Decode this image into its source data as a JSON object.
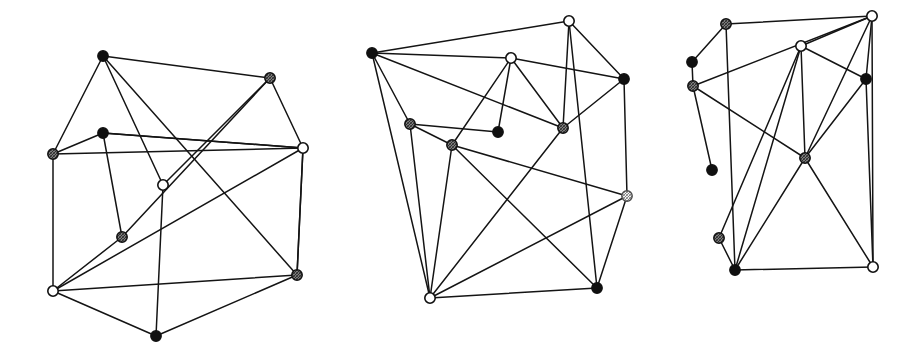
{
  "figure": {
    "background_color": "#ffffff",
    "edge_color": "#141414",
    "width": 915,
    "height": 349,
    "node_radius": 5.2,
    "node_types": {
      "black": {
        "label": "filled black vertex",
        "fill": "#101010",
        "stroke": "#101010"
      },
      "gray": {
        "label": "hatched gray vertex",
        "fill": "#8c8c8c",
        "stroke": "#101010"
      },
      "white": {
        "label": "open white vertex",
        "fill": "#ffffff",
        "stroke": "#101010"
      },
      "light": {
        "label": "light hatched vertex",
        "fill": "#e8e8e8",
        "stroke": "#4a4a4a"
      }
    }
  },
  "graphs": [
    {
      "name": "graph-left",
      "label": "Left graph",
      "node_count": 10,
      "edge_count": 20,
      "nodes": [
        {
          "id": "L0",
          "x": 103,
          "y": 56,
          "type": "black"
        },
        {
          "id": "L1",
          "x": 270,
          "y": 78,
          "type": "gray"
        },
        {
          "id": "L2",
          "x": 303,
          "y": 148,
          "type": "white"
        },
        {
          "id": "L3",
          "x": 103,
          "y": 133,
          "type": "black"
        },
        {
          "id": "L4",
          "x": 53,
          "y": 154,
          "type": "gray"
        },
        {
          "id": "L5",
          "x": 163,
          "y": 185,
          "type": "white"
        },
        {
          "id": "L6",
          "x": 122,
          "y": 237,
          "type": "gray"
        },
        {
          "id": "L7",
          "x": 53,
          "y": 291,
          "type": "white"
        },
        {
          "id": "L8",
          "x": 297,
          "y": 275,
          "type": "gray"
        },
        {
          "id": "L9",
          "x": 156,
          "y": 336,
          "type": "black"
        }
      ],
      "edges": [
        [
          "L0",
          "L1"
        ],
        [
          "L0",
          "L4"
        ],
        [
          "L0",
          "L5"
        ],
        [
          "L0",
          "L8"
        ],
        [
          "L1",
          "L2"
        ],
        [
          "L1",
          "L6"
        ],
        [
          "L2",
          "L3"
        ],
        [
          "L2",
          "L4"
        ],
        [
          "L2",
          "L7"
        ],
        [
          "L2",
          "L8"
        ],
        [
          "L3",
          "L4"
        ],
        [
          "L3",
          "L6"
        ],
        [
          "L3",
          "L2"
        ],
        [
          "L4",
          "L7"
        ],
        [
          "L5",
          "L9"
        ],
        [
          "L5",
          "L1"
        ],
        [
          "L6",
          "L7"
        ],
        [
          "L7",
          "L8"
        ],
        [
          "L7",
          "L9"
        ],
        [
          "L8",
          "L9"
        ],
        [
          "L8",
          "L2"
        ]
      ]
    },
    {
      "name": "graph-middle",
      "label": "Middle graph",
      "node_count": 10,
      "edge_count": 22,
      "nodes": [
        {
          "id": "M0",
          "x": 569,
          "y": 21,
          "type": "white"
        },
        {
          "id": "M1",
          "x": 372,
          "y": 53,
          "type": "black"
        },
        {
          "id": "M2",
          "x": 511,
          "y": 58,
          "type": "white"
        },
        {
          "id": "M3",
          "x": 624,
          "y": 79,
          "type": "black"
        },
        {
          "id": "M4",
          "x": 410,
          "y": 124,
          "type": "gray"
        },
        {
          "id": "M5",
          "x": 498,
          "y": 132,
          "type": "black"
        },
        {
          "id": "M6",
          "x": 563,
          "y": 128,
          "type": "gray"
        },
        {
          "id": "M7",
          "x": 452,
          "y": 145,
          "type": "gray"
        },
        {
          "id": "M8",
          "x": 627,
          "y": 196,
          "type": "light"
        },
        {
          "id": "M9",
          "x": 430,
          "y": 298,
          "type": "white"
        },
        {
          "id": "M10",
          "x": 597,
          "y": 288,
          "type": "black"
        }
      ],
      "edges": [
        [
          "M0",
          "M1"
        ],
        [
          "M0",
          "M3"
        ],
        [
          "M0",
          "M6"
        ],
        [
          "M0",
          "M10"
        ],
        [
          "M1",
          "M4"
        ],
        [
          "M1",
          "M6"
        ],
        [
          "M1",
          "M9"
        ],
        [
          "M1",
          "M2"
        ],
        [
          "M2",
          "M7"
        ],
        [
          "M2",
          "M6"
        ],
        [
          "M2",
          "M3"
        ],
        [
          "M3",
          "M6"
        ],
        [
          "M3",
          "M8"
        ],
        [
          "M4",
          "M5"
        ],
        [
          "M4",
          "M9"
        ],
        [
          "M4",
          "M7"
        ],
        [
          "M5",
          "M2"
        ],
        [
          "M6",
          "M9"
        ],
        [
          "M7",
          "M8"
        ],
        [
          "M7",
          "M9"
        ],
        [
          "M7",
          "M10"
        ],
        [
          "M8",
          "M9"
        ],
        [
          "M8",
          "M10"
        ],
        [
          "M9",
          "M10"
        ]
      ]
    },
    {
      "name": "graph-right",
      "label": "Right graph",
      "node_count": 10,
      "edge_count": 21,
      "nodes": [
        {
          "id": "R0",
          "x": 726,
          "y": 24,
          "type": "gray"
        },
        {
          "id": "R1",
          "x": 872,
          "y": 16,
          "type": "white"
        },
        {
          "id": "R2",
          "x": 801,
          "y": 46,
          "type": "white"
        },
        {
          "id": "R3",
          "x": 692,
          "y": 62,
          "type": "black"
        },
        {
          "id": "R4",
          "x": 693,
          "y": 86,
          "type": "gray"
        },
        {
          "id": "R5",
          "x": 866,
          "y": 79,
          "type": "black"
        },
        {
          "id": "R6",
          "x": 712,
          "y": 170,
          "type": "black"
        },
        {
          "id": "R7",
          "x": 805,
          "y": 158,
          "type": "gray"
        },
        {
          "id": "R8",
          "x": 719,
          "y": 238,
          "type": "gray"
        },
        {
          "id": "R9",
          "x": 735,
          "y": 270,
          "type": "black"
        },
        {
          "id": "R10",
          "x": 873,
          "y": 267,
          "type": "white"
        }
      ],
      "edges": [
        [
          "R0",
          "R1"
        ],
        [
          "R0",
          "R3"
        ],
        [
          "R0",
          "R9"
        ],
        [
          "R1",
          "R4"
        ],
        [
          "R1",
          "R5"
        ],
        [
          "R1",
          "R7"
        ],
        [
          "R1",
          "R10"
        ],
        [
          "R1",
          "R2"
        ],
        [
          "R2",
          "R5"
        ],
        [
          "R2",
          "R7"
        ],
        [
          "R2",
          "R9"
        ],
        [
          "R2",
          "R8"
        ],
        [
          "R3",
          "R4"
        ],
        [
          "R4",
          "R6"
        ],
        [
          "R4",
          "R7"
        ],
        [
          "R5",
          "R7"
        ],
        [
          "R5",
          "R10"
        ],
        [
          "R7",
          "R9"
        ],
        [
          "R7",
          "R10"
        ],
        [
          "R8",
          "R9"
        ],
        [
          "R9",
          "R10"
        ]
      ]
    }
  ]
}
